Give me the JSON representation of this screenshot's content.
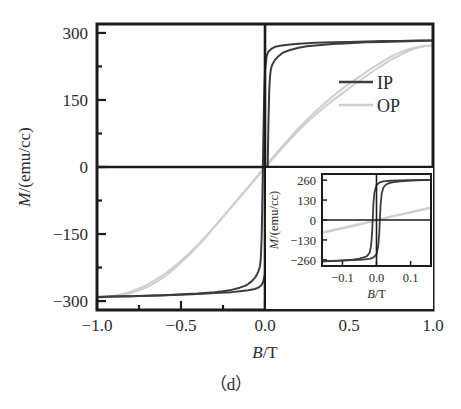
{
  "figure": {
    "caption": "（d）",
    "background": "#ffffff"
  },
  "chart_data": {
    "type": "line",
    "title": "",
    "subtitle": "",
    "xlabel": "B/T",
    "ylabel": "M/(emu/cc)",
    "xlim": [
      -1.0,
      1.0
    ],
    "ylim": [
      -320,
      320
    ],
    "grid": false,
    "legend_position": "upper-right",
    "xticks": [
      -1.0,
      -0.5,
      0.0,
      0.5,
      1.0
    ],
    "xticklabels": [
      "−1.0",
      "−0.5",
      "0.0",
      "0.5",
      "1.0"
    ],
    "yticks": [
      -300,
      -150,
      0,
      150,
      300
    ],
    "yticklabels": [
      "−300",
      "−150",
      "0",
      "150",
      "300"
    ],
    "xminorticks": [
      -0.75,
      -0.25,
      0.25,
      0.75
    ],
    "yminorticks": [
      -225,
      -75,
      75,
      225
    ],
    "annotations": [
      "hysteresis loop, in-plane (IP) vs out-of-plane (OP)"
    ],
    "series": [
      {
        "name": "IP",
        "color": "#3d3d3d",
        "width": 2.0,
        "saturation_M": 283,
        "coercivity_T": 0.022,
        "branch_down": [
          [
            1.0,
            283
          ],
          [
            0.9,
            282
          ],
          [
            0.8,
            281
          ],
          [
            0.7,
            280
          ],
          [
            0.6,
            279
          ],
          [
            0.5,
            277
          ],
          [
            0.4,
            275
          ],
          [
            0.3,
            272
          ],
          [
            0.25,
            270
          ],
          [
            0.2,
            267
          ],
          [
            0.15,
            262
          ],
          [
            0.12,
            258
          ],
          [
            0.1,
            254
          ],
          [
            0.08,
            248
          ],
          [
            0.06,
            240
          ],
          [
            0.05,
            234
          ],
          [
            0.04,
            226
          ],
          [
            0.035,
            218
          ],
          [
            0.03,
            204
          ],
          [
            0.025,
            170
          ],
          [
            0.02,
            90
          ],
          [
            0.015,
            -20
          ],
          [
            0.01,
            -140
          ],
          [
            0.005,
            -210
          ],
          [
            0.0,
            -238
          ],
          [
            -0.01,
            -256
          ],
          [
            -0.02,
            -264
          ],
          [
            -0.04,
            -270
          ],
          [
            -0.06,
            -273
          ],
          [
            -0.1,
            -276
          ],
          [
            -0.15,
            -278
          ],
          [
            -0.2,
            -280
          ],
          [
            -0.3,
            -282
          ],
          [
            -0.4,
            -284
          ],
          [
            -0.5,
            -286
          ],
          [
            -0.6,
            -287
          ],
          [
            -0.7,
            -288
          ],
          [
            -0.8,
            -289
          ],
          [
            -0.9,
            -290
          ],
          [
            -1.0,
            -291
          ]
        ],
        "branch_up": [
          [
            -1.0,
            -291
          ],
          [
            -0.9,
            -290
          ],
          [
            -0.8,
            -289
          ],
          [
            -0.7,
            -288
          ],
          [
            -0.6,
            -287
          ],
          [
            -0.5,
            -285
          ],
          [
            -0.4,
            -283
          ],
          [
            -0.3,
            -280
          ],
          [
            -0.25,
            -278
          ],
          [
            -0.2,
            -275
          ],
          [
            -0.15,
            -270
          ],
          [
            -0.12,
            -266
          ],
          [
            -0.1,
            -262
          ],
          [
            -0.08,
            -256
          ],
          [
            -0.06,
            -248
          ],
          [
            -0.05,
            -242
          ],
          [
            -0.04,
            -234
          ],
          [
            -0.03,
            -222
          ],
          [
            -0.025,
            -205
          ],
          [
            -0.02,
            -160
          ],
          [
            -0.015,
            -60
          ],
          [
            -0.01,
            60
          ],
          [
            -0.005,
            160
          ],
          [
            0.0,
            215
          ],
          [
            0.01,
            248
          ],
          [
            0.02,
            258
          ],
          [
            0.04,
            265
          ],
          [
            0.06,
            269
          ],
          [
            0.1,
            272
          ],
          [
            0.15,
            274
          ],
          [
            0.2,
            276
          ],
          [
            0.3,
            278
          ],
          [
            0.4,
            279
          ],
          [
            0.5,
            280
          ],
          [
            0.6,
            281
          ],
          [
            0.7,
            282
          ],
          [
            0.8,
            282
          ],
          [
            0.9,
            283
          ],
          [
            1.0,
            283
          ]
        ]
      },
      {
        "name": "OP",
        "color": "#cfcfcf",
        "width": 2.0,
        "saturation_M": 272,
        "coercivity_T": 0.012,
        "branch_down": [
          [
            1.0,
            272
          ],
          [
            0.95,
            270
          ],
          [
            0.9,
            266
          ],
          [
            0.85,
            259
          ],
          [
            0.8,
            250
          ],
          [
            0.75,
            240
          ],
          [
            0.7,
            228
          ],
          [
            0.65,
            216
          ],
          [
            0.6,
            203
          ],
          [
            0.55,
            190
          ],
          [
            0.5,
            176
          ],
          [
            0.45,
            162
          ],
          [
            0.4,
            148
          ],
          [
            0.35,
            133
          ],
          [
            0.3,
            117
          ],
          [
            0.25,
            100
          ],
          [
            0.2,
            82
          ],
          [
            0.15,
            62
          ],
          [
            0.1,
            41
          ],
          [
            0.05,
            20
          ],
          [
            0.0,
            -2
          ],
          [
            -0.05,
            -24
          ],
          [
            -0.1,
            -46
          ],
          [
            -0.15,
            -68
          ],
          [
            -0.2,
            -90
          ],
          [
            -0.25,
            -112
          ],
          [
            -0.3,
            -134
          ],
          [
            -0.35,
            -156
          ],
          [
            -0.4,
            -177
          ],
          [
            -0.45,
            -196
          ],
          [
            -0.5,
            -214
          ],
          [
            -0.55,
            -231
          ],
          [
            -0.6,
            -246
          ],
          [
            -0.65,
            -258
          ],
          [
            -0.7,
            -268
          ],
          [
            -0.75,
            -276
          ],
          [
            -0.8,
            -282
          ],
          [
            -0.85,
            -286
          ],
          [
            -0.9,
            -289
          ],
          [
            -0.95,
            -291
          ],
          [
            -1.0,
            -293
          ]
        ],
        "branch_up": [
          [
            -1.0,
            -293
          ],
          [
            -0.95,
            -291
          ],
          [
            -0.9,
            -288
          ],
          [
            -0.85,
            -284
          ],
          [
            -0.8,
            -279
          ],
          [
            -0.75,
            -272
          ],
          [
            -0.7,
            -263
          ],
          [
            -0.65,
            -252
          ],
          [
            -0.6,
            -240
          ],
          [
            -0.55,
            -226
          ],
          [
            -0.5,
            -210
          ],
          [
            -0.45,
            -193
          ],
          [
            -0.4,
            -174
          ],
          [
            -0.35,
            -154
          ],
          [
            -0.3,
            -133
          ],
          [
            -0.25,
            -111
          ],
          [
            -0.2,
            -89
          ],
          [
            -0.15,
            -67
          ],
          [
            -0.1,
            -45
          ],
          [
            -0.05,
            -22
          ],
          [
            0.0,
            1
          ],
          [
            0.05,
            23
          ],
          [
            0.1,
            45
          ],
          [
            0.15,
            66
          ],
          [
            0.2,
            87
          ],
          [
            0.25,
            106
          ],
          [
            0.3,
            124
          ],
          [
            0.35,
            141
          ],
          [
            0.4,
            157
          ],
          [
            0.45,
            172
          ],
          [
            0.5,
            186
          ],
          [
            0.55,
            199
          ],
          [
            0.6,
            212
          ],
          [
            0.65,
            224
          ],
          [
            0.7,
            236
          ],
          [
            0.75,
            247
          ],
          [
            0.8,
            256
          ],
          [
            0.85,
            263
          ],
          [
            0.9,
            268
          ],
          [
            0.95,
            271
          ],
          [
            1.0,
            272
          ]
        ]
      }
    ],
    "legend": [
      {
        "label": "IP",
        "color": "#3d3d3d"
      },
      {
        "label": "OP",
        "color": "#cfcfcf"
      }
    ],
    "inset": {
      "type": "line",
      "xlabel": "B/T",
      "ylabel": "M/(emu/cc)",
      "xlim": [
        -0.16,
        0.16
      ],
      "ylim": [
        -300,
        300
      ],
      "grid": false,
      "xticks": [
        -0.1,
        0.0,
        0.1
      ],
      "xticklabels": [
        "−0.1",
        "0.0",
        "0.1"
      ],
      "yticks": [
        -260,
        -130,
        0,
        130,
        260
      ],
      "yticklabels": [
        "−260",
        "−130",
        "0",
        "130",
        "260"
      ],
      "series": [
        {
          "name": "IP",
          "color": "#3d3d3d",
          "width": 1.8,
          "branch_down": [
            [
              0.16,
              262
            ],
            [
              0.12,
              259
            ],
            [
              0.09,
              256
            ],
            [
              0.07,
              252
            ],
            [
              0.05,
              247
            ],
            [
              0.04,
              242
            ],
            [
              0.03,
              234
            ],
            [
              0.025,
              225
            ],
            [
              0.02,
              210
            ],
            [
              0.015,
              170
            ],
            [
              0.012,
              100
            ],
            [
              0.01,
              10
            ],
            [
              0.008,
              -90
            ],
            [
              0.005,
              -170
            ],
            [
              0.0,
              -225
            ],
            [
              -0.01,
              -245
            ],
            [
              -0.02,
              -253
            ],
            [
              -0.04,
              -258
            ],
            [
              -0.07,
              -262
            ],
            [
              -0.1,
              -265
            ],
            [
              -0.13,
              -268
            ],
            [
              -0.16,
              -270
            ]
          ],
          "branch_up": [
            [
              -0.16,
              -270
            ],
            [
              -0.13,
              -267
            ],
            [
              -0.1,
              -263
            ],
            [
              -0.07,
              -258
            ],
            [
              -0.05,
              -252
            ],
            [
              -0.04,
              -246
            ],
            [
              -0.03,
              -238
            ],
            [
              -0.025,
              -228
            ],
            [
              -0.02,
              -212
            ],
            [
              -0.016,
              -170
            ],
            [
              -0.013,
              -90
            ],
            [
              -0.011,
              10
            ],
            [
              -0.009,
              110
            ],
            [
              -0.006,
              180
            ],
            [
              0.0,
              228
            ],
            [
              0.01,
              246
            ],
            [
              0.02,
              252
            ],
            [
              0.04,
              256
            ],
            [
              0.07,
              258
            ],
            [
              0.1,
              260
            ],
            [
              0.13,
              261
            ],
            [
              0.16,
              262
            ]
          ]
        },
        {
          "name": "OP",
          "color": "#cfcfcf",
          "width": 1.8,
          "branch_down": [
            [
              0.16,
              78
            ],
            [
              0.12,
              58
            ],
            [
              0.08,
              38
            ],
            [
              0.04,
              18
            ],
            [
              0.0,
              -4
            ],
            [
              -0.04,
              -26
            ],
            [
              -0.08,
              -46
            ],
            [
              -0.12,
              -66
            ],
            [
              -0.16,
              -86
            ]
          ],
          "branch_up": [
            [
              -0.16,
              -80
            ],
            [
              -0.12,
              -60
            ],
            [
              -0.08,
              -40
            ],
            [
              -0.04,
              -20
            ],
            [
              0.0,
              2
            ],
            [
              0.04,
              22
            ],
            [
              0.08,
              42
            ],
            [
              0.12,
              62
            ],
            [
              0.16,
              82
            ]
          ]
        }
      ]
    }
  }
}
